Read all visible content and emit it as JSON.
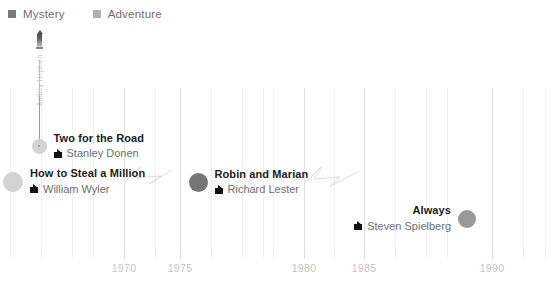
{
  "legend": {
    "items": [
      {
        "label": "Mystery",
        "color": "#7a7a7a",
        "icon": "square-swatch-icon"
      },
      {
        "label": "Adventure",
        "color": "#b0b0b0",
        "icon": "square-swatch-icon"
      }
    ]
  },
  "annotation": {
    "label": "Audrey Hepburn",
    "icon": "lighthouse-marker-icon",
    "x": 39,
    "top": 30,
    "stem_top": 60,
    "stem_height": 80
  },
  "axis": {
    "tick_labels": [
      "1970",
      "1975",
      "1980",
      "1985",
      "1990"
    ],
    "major_ticks": [
      {
        "label": "1970",
        "x": 124
      },
      {
        "label": "1975",
        "x": 180
      },
      {
        "label": "1980",
        "x": 304
      },
      {
        "label": "1985",
        "x": 364
      },
      {
        "label": "1990",
        "x": 492
      }
    ],
    "minor_tick_x": [
      10,
      41,
      72,
      93,
      155,
      211,
      242,
      263,
      273,
      334,
      395,
      426,
      447,
      523,
      545
    ],
    "grid_x": [
      10,
      41,
      72,
      93,
      124,
      155,
      180,
      211,
      242,
      263,
      273,
      304,
      334,
      364,
      395,
      426,
      447,
      492,
      523,
      545
    ],
    "major_grid_x": [
      124,
      180,
      304,
      364,
      492
    ]
  },
  "connectors": [
    {
      "name": "zigzag-connector-1",
      "left": 125,
      "top": 164,
      "points": "0,18 16,2 9,14 36,12 24,20 47,6"
    },
    {
      "name": "zigzag-connector-2",
      "left": 304,
      "top": 164,
      "points": "0,20 18,2 10,15 36,13 26,22 54,8"
    }
  ],
  "events": [
    {
      "id": "two-for-the-road",
      "title": "Two for the Road",
      "director": "Stanley Donen",
      "genre": "Adventure",
      "bubble_color": "#d4d4d4",
      "bubble_size": 15,
      "has_center_dot": true,
      "x": 39,
      "y": 139,
      "align": "left",
      "stem": {
        "top": -43,
        "height": 43
      }
    },
    {
      "id": "how-to-steal-a-million",
      "title": "How to Steal a Million",
      "director": "William Wyler",
      "genre": "Adventure",
      "bubble_color": "#d2d2d2",
      "bubble_size": 20,
      "has_center_dot": false,
      "x": 13,
      "y": 177,
      "align": "left",
      "stem": null
    },
    {
      "id": "robin-and-marian",
      "title": "Robin and Marian",
      "director": "Richard Lester",
      "genre": "Mystery",
      "bubble_color": "#757575",
      "bubble_size": 19,
      "has_center_dot": false,
      "x": 198,
      "y": 177,
      "align": "left",
      "stem": null
    },
    {
      "id": "always",
      "title": "Always",
      "director": "Steven Spielberg",
      "genre": "Mystery",
      "bubble_color": "#999999",
      "bubble_size": 18,
      "has_center_dot": false,
      "x": 467,
      "y": 213,
      "align": "right",
      "stem": null
    }
  ],
  "chart_data": {
    "type": "scatter",
    "title": "",
    "xlabel": "",
    "ylabel": "",
    "xlim": [
      1966,
      1991
    ],
    "grid": true,
    "legend_position": "top-left",
    "categories": [
      "Mystery",
      "Adventure"
    ],
    "series": [
      {
        "name": "Adventure",
        "color": "#b0b0b0",
        "points": [
          {
            "label": "How to Steal a Million",
            "director": "William Wyler",
            "year": 1966
          },
          {
            "label": "Two for the Road",
            "director": "Stanley Donen",
            "year": 1967
          }
        ]
      },
      {
        "name": "Mystery",
        "color": "#7a7a7a",
        "points": [
          {
            "label": "Robin and Marian",
            "director": "Richard Lester",
            "year": 1976
          },
          {
            "label": "Always",
            "director": "Steven Spielberg",
            "year": 1989
          }
        ]
      }
    ],
    "tick_labels": [
      "1970",
      "1975",
      "1980",
      "1985",
      "1990"
    ],
    "annotations": [
      {
        "text": "Audrey Hepburn",
        "year": 1967
      }
    ]
  }
}
